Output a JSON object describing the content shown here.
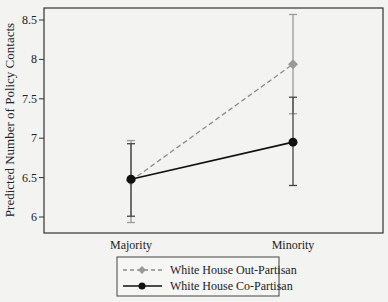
{
  "chart_data": {
    "type": "line",
    "title": "",
    "xlabel": "",
    "ylabel": "Predicted Number of Policy Contacts",
    "categories": [
      "Majority",
      "Minority"
    ],
    "ylim": [
      5.85,
      8.65
    ],
    "yticks": [
      6,
      6.5,
      7,
      7.5,
      8,
      8.5
    ],
    "ytick_labels": [
      "6",
      "6.5",
      "7",
      "7.5",
      "8",
      "8.5"
    ],
    "grid": false,
    "legend_position": "bottom",
    "series": [
      {
        "name": "White House Out-Partisan",
        "values": [
          6.46,
          7.94
        ],
        "ci_lower": [
          5.93,
          7.31
        ],
        "ci_upper": [
          6.97,
          8.57
        ],
        "marker": "diamond",
        "line_style": "dashed",
        "color": "#8c8c8c"
      },
      {
        "name": "White House Co-Partisan",
        "values": [
          6.48,
          6.95
        ],
        "ci_lower": [
          6.01,
          6.4
        ],
        "ci_upper": [
          6.93,
          7.52
        ],
        "marker": "circle",
        "line_style": "solid",
        "color": "#111111"
      }
    ]
  }
}
